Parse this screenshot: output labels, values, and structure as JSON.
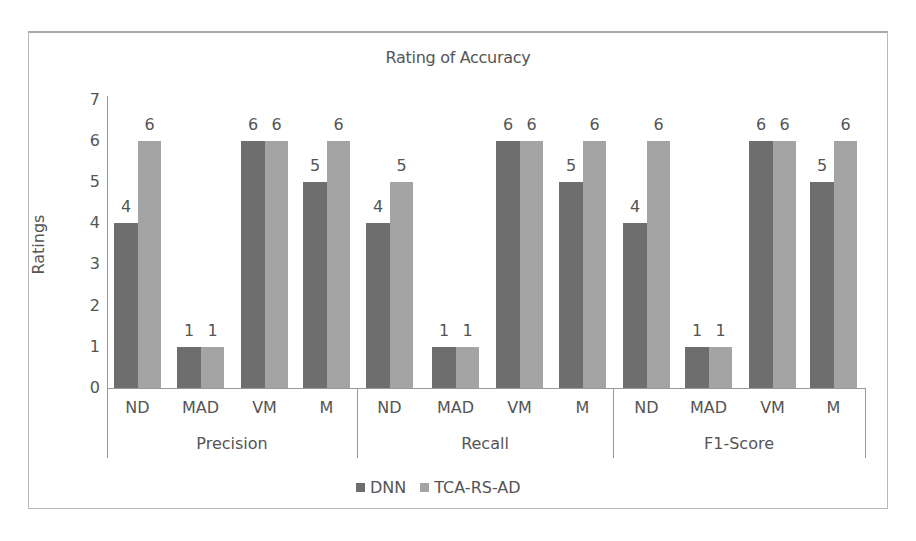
{
  "chart_data": {
    "type": "bar",
    "title": "Rating of Accuracy",
    "xlabel": "",
    "ylabel": "Ratings",
    "ylim": [
      0,
      7
    ],
    "yticks": [
      0,
      1,
      2,
      3,
      4,
      5,
      6,
      7
    ],
    "grid": false,
    "legend_position": "bottom",
    "groups": [
      "Precision",
      "Recall",
      "F1-Score"
    ],
    "categories": [
      "ND",
      "MAD",
      "VM",
      "M",
      "ND",
      "MAD",
      "VM",
      "M",
      "ND",
      "MAD",
      "VM",
      "M"
    ],
    "series": [
      {
        "name": "DNN",
        "color": "#6e6e6e",
        "values": [
          4,
          1,
          6,
          5,
          4,
          1,
          6,
          5,
          4,
          1,
          6,
          5
        ]
      },
      {
        "name": "TCA-RS-AD",
        "color": "#a4a4a4",
        "values": [
          6,
          1,
          6,
          6,
          5,
          1,
          6,
          6,
          6,
          1,
          6,
          6
        ]
      }
    ]
  },
  "labels": {
    "title": "Rating of Accuracy",
    "ylabel": "Ratings",
    "legend": [
      "DNN",
      "TCA-RS-AD"
    ],
    "groups": [
      "Precision",
      "Recall",
      "F1-Score"
    ]
  }
}
